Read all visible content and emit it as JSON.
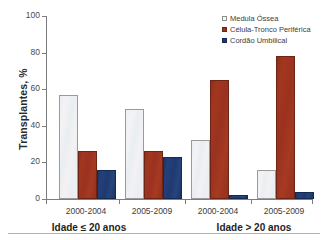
{
  "chart_data": {
    "type": "bar",
    "title": "",
    "xlabel": "",
    "ylabel": "Transplantes, %",
    "ylim": [
      0,
      100
    ],
    "yticks": [
      0,
      20,
      40,
      60,
      80,
      100
    ],
    "ytick_labels": [
      "0",
      "20",
      "40",
      "60",
      "80",
      "100"
    ],
    "grid": false,
    "legend_position": "top-right",
    "categories": [
      "2000-2004",
      "2005-2009",
      "2000-2004",
      "2005-2009"
    ],
    "group_labels": [
      "Idade ≤ 20 anos",
      "Idade > 20 anos"
    ],
    "groups": [
      {
        "label": "Idade ≤ 20 anos",
        "categories": [
          "2000-2004",
          "2005-2009"
        ]
      },
      {
        "label": "Idade > 20 anos",
        "categories": [
          "2000-2004",
          "2005-2009"
        ]
      }
    ],
    "series": [
      {
        "name": "Medula Óssea",
        "color": "#f1f1f3",
        "edge_color": "#9a9a9a",
        "values": [
          57,
          49,
          32,
          16
        ]
      },
      {
        "name": "Célula-Tronco Periférica",
        "color": "#9a3220",
        "edge_color": "#6d2414",
        "values": [
          26,
          26,
          65,
          78
        ]
      },
      {
        "name": "Cordão Umbilical",
        "color": "#1f3a70",
        "edge_color": "#152a52",
        "values": [
          16,
          23,
          2,
          4
        ]
      }
    ]
  },
  "legend": {
    "items": [
      {
        "label": "Medula Óssea",
        "swatch": "legend-swatch-medula-ossea"
      },
      {
        "label": "Célula-Tronco Periférica",
        "swatch": "legend-swatch-celula-tronco-periferica"
      },
      {
        "label": "Cordão Umbilical",
        "swatch": "legend-swatch-cordao-umbilical"
      }
    ]
  },
  "axes": {
    "y_title": "Transplantes, %",
    "y_tick_labels": [
      "100",
      "80",
      "60",
      "40",
      "20",
      "0"
    ],
    "x_category_labels": [
      "2000-2004",
      "2005-2009",
      "2000-2004",
      "2005-2009"
    ],
    "x_group_labels": [
      "Idade ≤ 20 anos",
      "Idade > 20 anos"
    ]
  },
  "colors": {
    "series_medula_ossea": "#f1f1f3",
    "series_celula_tronco": "#9a3220",
    "series_cordao_umbilical": "#1f3a70",
    "axis": "#7d7d7d",
    "footer_rule": "#c9a9a4",
    "background": "#ffffff"
  }
}
